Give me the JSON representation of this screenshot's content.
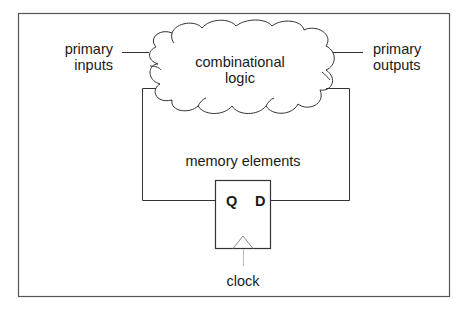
{
  "diagram": {
    "type": "sequential-circuit-block-diagram",
    "labels": {
      "primary_inputs": [
        "primary",
        "inputs"
      ],
      "primary_outputs": [
        "primary",
        "outputs"
      ],
      "combinational_logic": [
        "combinational",
        "logic"
      ],
      "memory_elements": "memory elements",
      "q_port": "Q",
      "d_port": "D",
      "clock": "clock"
    },
    "colors": {
      "line": "#333333",
      "text": "#1a1a1a",
      "frame": "#555555",
      "clock_line": "#999999"
    }
  }
}
